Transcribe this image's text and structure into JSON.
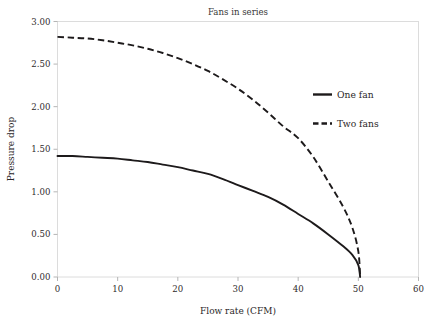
{
  "chart_data": {
    "type": "line",
    "title": "Fans in series",
    "xlabel": "Flow rate (CFM)",
    "ylabel": "Pressure drop",
    "xlim": [
      0,
      60
    ],
    "ylim": [
      0,
      3.0
    ],
    "xticks": [
      "0",
      "10",
      "20",
      "30",
      "40",
      "50",
      "60"
    ],
    "xtick_values": [
      0,
      10,
      20,
      30,
      40,
      50,
      60
    ],
    "yticks": [
      "0.00",
      "0.50",
      "1.00",
      "1.50",
      "2.00",
      "2.50",
      "3.00"
    ],
    "ytick_values": [
      0,
      0.5,
      1.0,
      1.5,
      2.0,
      2.5,
      3.0
    ],
    "grid": false,
    "legend_position": "upper right inside",
    "x": [
      0,
      2.5,
      5,
      7.5,
      10,
      12.5,
      15,
      17.5,
      20,
      22.5,
      25,
      27.5,
      30,
      32.5,
      35,
      37.5,
      40,
      42.5,
      45,
      47.5,
      49,
      50,
      50.3
    ],
    "series": [
      {
        "name": "One fan",
        "style": "solid",
        "color": "#1d1a1b",
        "values": [
          1.42,
          1.42,
          1.41,
          1.4,
          1.39,
          1.37,
          1.35,
          1.32,
          1.29,
          1.25,
          1.21,
          1.15,
          1.08,
          1.01,
          0.94,
          0.85,
          0.74,
          0.63,
          0.5,
          0.36,
          0.26,
          0.14,
          0.0
        ]
      },
      {
        "name": "Two fans",
        "style": "dashed",
        "color": "#1d1a1b",
        "values": [
          2.82,
          2.81,
          2.8,
          2.78,
          2.75,
          2.72,
          2.68,
          2.63,
          2.57,
          2.5,
          2.42,
          2.32,
          2.21,
          2.08,
          1.93,
          1.77,
          1.63,
          1.41,
          1.12,
          0.82,
          0.58,
          0.3,
          0.0
        ]
      }
    ],
    "legend": [
      {
        "label": "One fan",
        "style": "solid"
      },
      {
        "label": "Two fans",
        "style": "dashed"
      }
    ],
    "axis_border_color": "#d9d9d9",
    "tick_color": "#b3b3b3",
    "text_color": "#2b2728"
  }
}
